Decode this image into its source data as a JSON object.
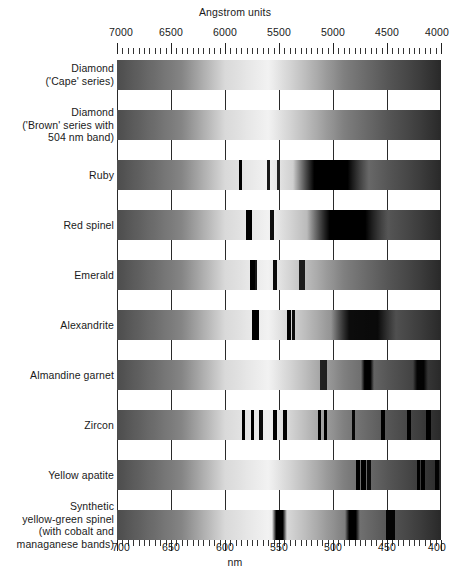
{
  "chart_data": {
    "type": "heatmap",
    "top_axis": {
      "label": "Angstrom units",
      "ticks": [
        7000,
        6500,
        6000,
        5500,
        5000,
        4500,
        4000
      ],
      "range": [
        7000,
        4000
      ],
      "unit": "Angstrom"
    },
    "bottom_axis": {
      "label": "nm",
      "ticks": [
        700,
        650,
        600,
        550,
        500,
        450,
        400
      ],
      "range": [
        700,
        400
      ],
      "unit": "nm"
    },
    "gridlines": [
      7000,
      6500,
      6000,
      5500,
      5000,
      4500,
      4000
    ],
    "series": [
      {
        "name": "Diamond ('Cape' series)",
        "label_lines": [
          "Diamond",
          "('Cape' series)"
        ],
        "bands": [
          {
            "center_nm": 478,
            "width_nm": 7,
            "strength": 0.95
          },
          {
            "center_nm": 465,
            "width_nm": 3,
            "strength": 0.8
          },
          {
            "center_nm": 415,
            "width_nm": 10,
            "strength": 1.0
          }
        ]
      },
      {
        "name": "Diamond ('Brown' series with 504 nm band)",
        "label_lines": [
          "Diamond",
          "('Brown' series with",
          "504 nm band)"
        ],
        "bands": [
          {
            "center_nm": 504,
            "width_nm": 4,
            "strength": 0.95
          },
          {
            "center_nm": 498,
            "width_nm": 3,
            "strength": 0.55
          },
          {
            "center_nm": 415,
            "width_nm": 5,
            "strength": 0.6
          }
        ]
      },
      {
        "name": "Ruby",
        "label_lines": [
          "Ruby"
        ],
        "bands": [
          {
            "center_nm": 694,
            "width_nm": 3,
            "strength": 1.0
          },
          {
            "center_nm": 668,
            "width_nm": 3,
            "strength": 0.9
          },
          {
            "center_nm": 659,
            "width_nm": 3,
            "strength": 0.85
          },
          {
            "center_nm": 610,
            "width_nm": 70,
            "strength": 1.0
          },
          {
            "center_nm": 476,
            "width_nm": 3,
            "strength": 1.0
          },
          {
            "center_nm": 468,
            "width_nm": 3,
            "strength": 1.0
          },
          {
            "center_nm": 430,
            "width_nm": 45,
            "strength": 1.0
          }
        ]
      },
      {
        "name": "Red spinel",
        "label_lines": [
          "Red spinel"
        ],
        "bands": [
          {
            "center_nm": 686,
            "width_nm": 5,
            "strength": 1.0
          },
          {
            "center_nm": 665,
            "width_nm": 4,
            "strength": 0.95
          },
          {
            "center_nm": 595,
            "width_nm": 75,
            "strength": 1.0
          },
          {
            "center_nm": 460,
            "width_nm": 60,
            "strength": 1.0
          }
        ]
      },
      {
        "name": "Emerald",
        "label_lines": [
          "Emerald"
        ],
        "bands": [
          {
            "center_nm": 683,
            "width_nm": 4,
            "strength": 1.0
          },
          {
            "center_nm": 680,
            "width_nm": 3,
            "strength": 0.9
          },
          {
            "center_nm": 662,
            "width_nm": 4,
            "strength": 0.95
          },
          {
            "center_nm": 637,
            "width_nm": 5,
            "strength": 0.85
          },
          {
            "center_nm": 480,
            "width_nm": 50,
            "strength": 1.0
          },
          {
            "center_nm": 430,
            "width_nm": 6,
            "strength": 1.0
          }
        ]
      },
      {
        "name": "Alexandrite",
        "label_lines": [
          "Alexandrite"
        ],
        "bands": [
          {
            "center_nm": 680,
            "width_nm": 7,
            "strength": 1.0
          },
          {
            "center_nm": 649,
            "width_nm": 4,
            "strength": 1.0
          },
          {
            "center_nm": 645,
            "width_nm": 3,
            "strength": 0.95
          },
          {
            "center_nm": 580,
            "width_nm": 60,
            "strength": 0.9
          },
          {
            "center_nm": 430,
            "width_nm": 35,
            "strength": 1.0
          }
        ]
      },
      {
        "name": "Almandine garnet",
        "label_lines": [
          "Almandine garnet"
        ],
        "bands": [
          {
            "center_nm": 617,
            "width_nm": 6,
            "strength": 0.8
          },
          {
            "center_nm": 576,
            "width_nm": 12,
            "strength": 1.0
          },
          {
            "center_nm": 527,
            "width_nm": 14,
            "strength": 0.95
          },
          {
            "center_nm": 505,
            "width_nm": 6,
            "strength": 0.9
          },
          {
            "center_nm": 462,
            "width_nm": 4,
            "strength": 1.0
          },
          {
            "center_nm": 430,
            "width_nm": 25,
            "strength": 0.85
          }
        ]
      },
      {
        "name": "Zircon",
        "label_lines": [
          "Zircon"
        ],
        "bands": [
          {
            "center_nm": 691,
            "width_nm": 3,
            "strength": 1.0
          },
          {
            "center_nm": 683,
            "width_nm": 3,
            "strength": 1.0
          },
          {
            "center_nm": 675,
            "width_nm": 3,
            "strength": 0.95
          },
          {
            "center_nm": 662,
            "width_nm": 3,
            "strength": 1.0
          },
          {
            "center_nm": 653,
            "width_nm": 4,
            "strength": 1.0
          },
          {
            "center_nm": 621,
            "width_nm": 3,
            "strength": 1.0
          },
          {
            "center_nm": 615,
            "width_nm": 3,
            "strength": 1.0
          },
          {
            "center_nm": 589,
            "width_nm": 3,
            "strength": 0.95
          },
          {
            "center_nm": 562,
            "width_nm": 4,
            "strength": 1.0
          },
          {
            "center_nm": 538,
            "width_nm": 4,
            "strength": 1.0
          },
          {
            "center_nm": 520,
            "width_nm": 4,
            "strength": 1.0
          },
          {
            "center_nm": 484,
            "width_nm": 4,
            "strength": 1.0
          },
          {
            "center_nm": 432,
            "width_nm": 4,
            "strength": 1.0
          }
        ]
      },
      {
        "name": "Yellow apatite",
        "label_lines": [
          "Yellow apatite"
        ],
        "bands": [
          {
            "center_nm": 585,
            "width_nm": 4,
            "strength": 1.0
          },
          {
            "center_nm": 580,
            "width_nm": 4,
            "strength": 1.0
          },
          {
            "center_nm": 575,
            "width_nm": 3,
            "strength": 0.9
          },
          {
            "center_nm": 529,
            "width_nm": 3,
            "strength": 1.0
          },
          {
            "center_nm": 525,
            "width_nm": 3,
            "strength": 1.0
          },
          {
            "center_nm": 512,
            "width_nm": 3,
            "strength": 0.95
          },
          {
            "center_nm": 430,
            "width_nm": 35,
            "strength": 0.9
          }
        ]
      },
      {
        "name": "Synthetic yellow-green spinel (with cobalt and managanese bands)",
        "label_lines": [
          "Synthetic",
          "yellow-green spinel",
          "(with cobalt and",
          "managanese bands)"
        ],
        "bands": [
          {
            "center_nm": 658,
            "width_nm": 14,
            "strength": 1.0
          },
          {
            "center_nm": 590,
            "width_nm": 14,
            "strength": 1.0
          },
          {
            "center_nm": 555,
            "width_nm": 9,
            "strength": 0.95
          },
          {
            "center_nm": 455,
            "width_nm": 4,
            "strength": 1.0
          },
          {
            "center_nm": 432,
            "width_nm": 4,
            "strength": 1.0
          }
        ]
      }
    ]
  },
  "axes": {
    "top_title": "Angstrom units",
    "bottom_title": "nm",
    "top_ticks": [
      "7000",
      "6500",
      "6000",
      "5500",
      "5000",
      "4500",
      "4000"
    ],
    "bottom_ticks": [
      "700",
      "650",
      "600",
      "550",
      "500",
      "450",
      "400"
    ]
  },
  "rows": [
    {
      "id": "diamond-cape",
      "lines": [
        "Diamond",
        "('Cape' series)"
      ]
    },
    {
      "id": "diamond-brown",
      "lines": [
        "Diamond",
        "('Brown' series with",
        "504 nm band)"
      ]
    },
    {
      "id": "ruby",
      "lines": [
        "Ruby"
      ]
    },
    {
      "id": "red-spinel",
      "lines": [
        "Red spinel"
      ]
    },
    {
      "id": "emerald",
      "lines": [
        "Emerald"
      ]
    },
    {
      "id": "alexandrite",
      "lines": [
        "Alexandrite"
      ]
    },
    {
      "id": "almandine-garnet",
      "lines": [
        "Almandine garnet"
      ]
    },
    {
      "id": "zircon",
      "lines": [
        "Zircon"
      ]
    },
    {
      "id": "yellow-apatite",
      "lines": [
        "Yellow apatite"
      ]
    },
    {
      "id": "synthetic-spinel",
      "lines": [
        "Synthetic",
        "yellow-green spinel",
        "(with cobalt and",
        "managanese bands)"
      ]
    }
  ],
  "colors": {
    "ink": "#1a1a1a",
    "grid": "#2a2a2a",
    "background": "#ffffff",
    "band": "#000000"
  }
}
